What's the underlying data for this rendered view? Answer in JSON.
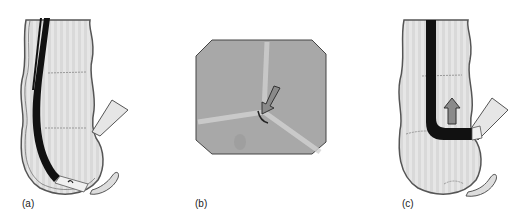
{
  "figure": {
    "panels": [
      {
        "id": "a",
        "label": "(a)",
        "description": "colonoscope looped in sigmoid/rectum, tip in rectal ampulla"
      },
      {
        "id": "b",
        "label": "(b)",
        "description": "endoscopic view of lumen with arrow indicating direction"
      },
      {
        "id": "c",
        "label": "(c)",
        "description": "colonoscope straightened with tip advanced into side lumen, upward arrow"
      }
    ],
    "colors": {
      "bowel_fill": "#e4e4e4",
      "bowel_outline": "#555555",
      "scope": "#111111",
      "view_bg": "#a8a8a8",
      "arrow": "#8a8a8a"
    }
  }
}
